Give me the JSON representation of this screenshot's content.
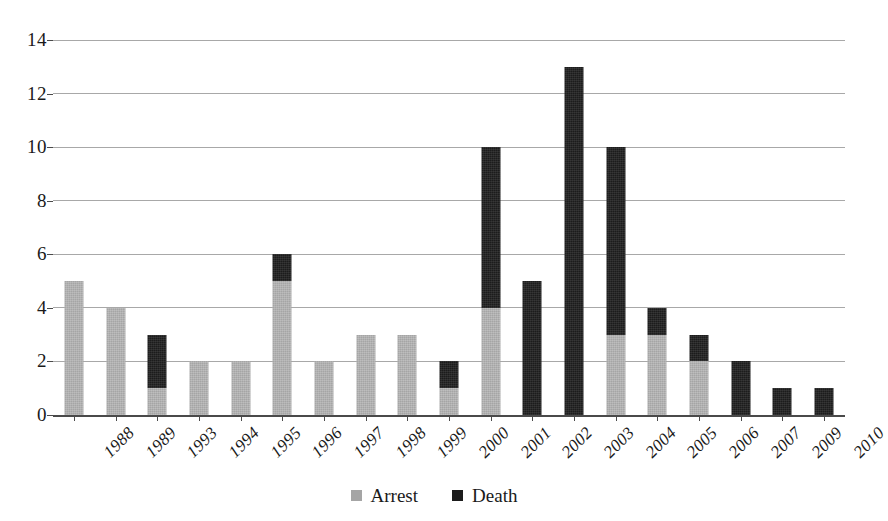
{
  "chart_data": {
    "type": "bar",
    "stacked": true,
    "title": "",
    "subtitle": "",
    "xlabel": "",
    "ylabel": "",
    "ylim": [
      0,
      14
    ],
    "ytick_step": 2,
    "yticks": [
      0,
      2,
      4,
      6,
      8,
      10,
      12,
      14
    ],
    "ytick_labels": [
      "0",
      "2",
      "4",
      "6",
      "8",
      "10",
      "12",
      "14"
    ],
    "grid": true,
    "grid_axis": "y",
    "legend_position": "bottom-center",
    "categories": [
      "1988",
      "1989",
      "1993",
      "1994",
      "1995",
      "1996",
      "1997",
      "1998",
      "1999",
      "2000",
      "2001",
      "2002",
      "2003",
      "2004",
      "2005",
      "2006",
      "2007",
      "2009",
      "2010"
    ],
    "series": [
      {
        "name": "Arrest",
        "color": "#a5a5a5",
        "values": [
          5,
          4,
          1,
          2,
          2,
          5,
          2,
          3,
          3,
          1,
          4,
          0,
          0,
          3,
          3,
          2,
          0,
          0,
          0
        ]
      },
      {
        "name": "Death",
        "color": "#1c1c1c",
        "values": [
          0,
          0,
          2,
          0,
          0,
          1,
          0,
          0,
          0,
          1,
          6,
          5,
          13,
          7,
          1,
          1,
          2,
          1,
          1
        ]
      }
    ],
    "totals": [
      5,
      4,
      3,
      2,
      2,
      6,
      2,
      3,
      3,
      2,
      10,
      5,
      13,
      10,
      4,
      3,
      2,
      1,
      1
    ]
  },
  "legend": {
    "items": [
      {
        "label": "Arrest",
        "swatch": "arrest-swatch"
      },
      {
        "label": "Death",
        "swatch": "death-swatch"
      }
    ]
  },
  "colors": {
    "arrest": "#a5a5a5",
    "death": "#1c1c1c",
    "gridline": "#a8a8a8",
    "axis": "#4a4a4a",
    "background": "#ffffff",
    "text": "#1a1a1a"
  }
}
